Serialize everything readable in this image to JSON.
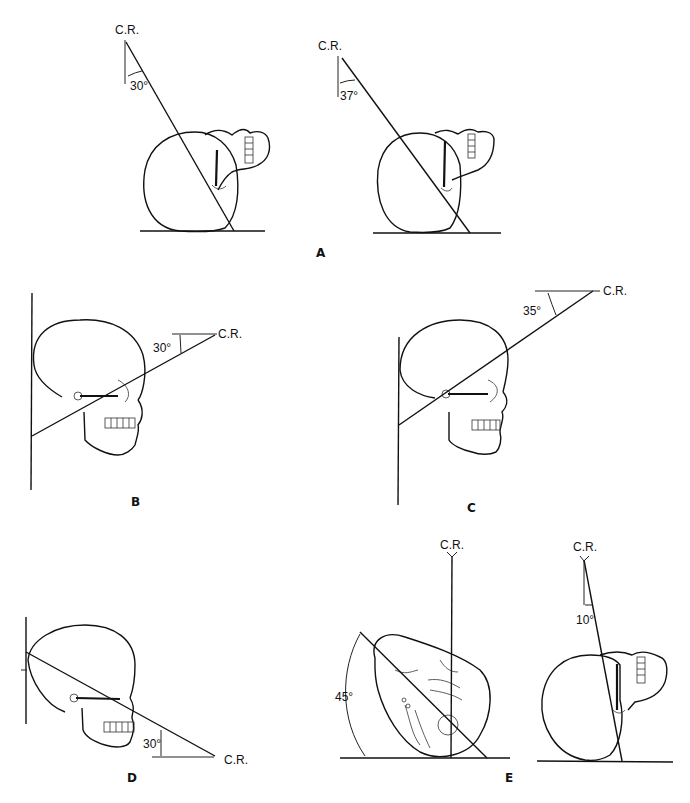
{
  "figure": {
    "central_ray_label": "C.R.",
    "panels": [
      {
        "id": "A",
        "label": "A",
        "views": [
          {
            "angle": "30°",
            "direction": "caudal"
          },
          {
            "angle": "37°",
            "direction": "caudal"
          }
        ]
      },
      {
        "id": "B",
        "label": "B",
        "angle": "30°"
      },
      {
        "id": "C",
        "label": "C",
        "angle": "35°"
      },
      {
        "id": "D",
        "label": "D",
        "angle": "30°"
      },
      {
        "id": "E",
        "label": "E",
        "views": [
          {
            "angle": "45°",
            "note": "head rotation"
          },
          {
            "angle": "10°",
            "direction": "caudal"
          }
        ]
      }
    ]
  },
  "labels": {
    "cr": "C.R.",
    "a_angle_1": "30°",
    "a_angle_2": "37°",
    "b_angle": "30°",
    "c_angle": "35°",
    "d_angle": "30°",
    "e_angle_1": "45°",
    "e_angle_2": "10°",
    "panel_a": "A",
    "panel_b": "B",
    "panel_c": "C",
    "panel_d": "D",
    "panel_e": "E"
  }
}
